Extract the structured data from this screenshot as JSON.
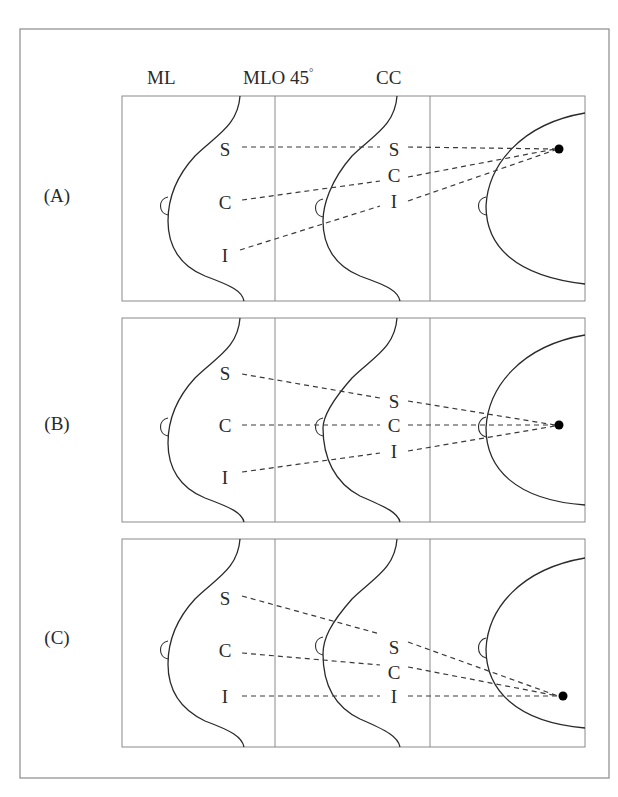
{
  "headers": {
    "ml": "ML",
    "mlo": "MLO 45",
    "mlo_degree": "°",
    "cc": "CC"
  },
  "rows": [
    {
      "label": "(A)",
      "ml_labels": {
        "s": "S",
        "c": "C",
        "i": "I"
      },
      "mlo_labels": {
        "s": "S",
        "c": "C",
        "i": "I"
      },
      "lesion_position_cc": "upper"
    },
    {
      "label": "(B)",
      "ml_labels": {
        "s": "S",
        "c": "C",
        "i": "I"
      },
      "mlo_labels": {
        "s": "S",
        "c": "C",
        "i": "I"
      },
      "lesion_position_cc": "center"
    },
    {
      "label": "(C)",
      "ml_labels": {
        "s": "S",
        "c": "C",
        "i": "I"
      },
      "mlo_labels": {
        "s": "S",
        "c": "C",
        "i": "I"
      },
      "lesion_position_cc": "lower"
    }
  ],
  "colors": {
    "frame": "#8a8a8a",
    "outline": "#2a2a2a",
    "lesion": "#000000"
  }
}
